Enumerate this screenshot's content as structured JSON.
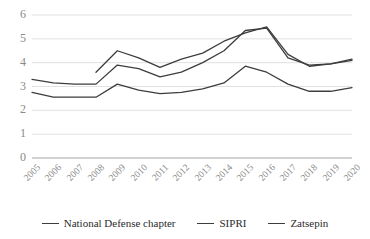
{
  "chart_data": {
    "type": "line",
    "title": "",
    "xlabel": "",
    "ylabel": "",
    "categories": [
      "2005",
      "2006",
      "2007",
      "2008",
      "2009",
      "2010",
      "2011",
      "2012",
      "2013",
      "2014",
      "2015",
      "2016",
      "2017",
      "2018",
      "2019",
      "2020"
    ],
    "ylim": [
      0,
      6
    ],
    "yticks": [
      0,
      1,
      2,
      3,
      4,
      5,
      6
    ],
    "grid": true,
    "legend_position": "bottom",
    "series": [
      {
        "name": "National Defense chapter",
        "color": "#3d3d3d",
        "values": [
          2.75,
          2.55,
          2.55,
          2.55,
          3.1,
          2.85,
          2.7,
          2.75,
          2.9,
          3.15,
          3.85,
          3.6,
          3.1,
          2.8,
          2.8,
          2.95
        ]
      },
      {
        "name": "SIPRI",
        "color": "#3d3d3d",
        "values": [
          3.3,
          3.15,
          3.1,
          3.1,
          3.9,
          3.75,
          3.4,
          3.6,
          4.0,
          4.5,
          5.35,
          5.45,
          4.2,
          3.9,
          3.95,
          4.1
        ]
      },
      {
        "name": "Zatsepin",
        "color": "#3d3d3d",
        "values": [
          null,
          null,
          null,
          3.6,
          4.5,
          4.2,
          3.8,
          4.15,
          4.4,
          4.9,
          5.25,
          5.5,
          4.35,
          3.85,
          3.95,
          4.15
        ]
      }
    ]
  },
  "axis": {
    "ytick_labels": [
      "6",
      "5",
      "4",
      "3",
      "2",
      "1",
      "0"
    ],
    "xtick_labels": [
      "2005",
      "2006",
      "2007",
      "2008",
      "2009",
      "2010",
      "2011",
      "2012",
      "2013",
      "2014",
      "2015",
      "2016",
      "2017",
      "2018",
      "2019",
      "2020"
    ]
  },
  "legend": {
    "items": [
      {
        "label": "National Defense chapter"
      },
      {
        "label": "SIPRI"
      },
      {
        "label": "Zatsepin"
      }
    ]
  },
  "colors": {
    "line": "#3d3d3d",
    "grid": "#d9d9d9",
    "axis": "#a6a6a6",
    "tick_text": "#8a8a8a",
    "legend_text": "#2b2b2b",
    "background": "#ffffff"
  }
}
